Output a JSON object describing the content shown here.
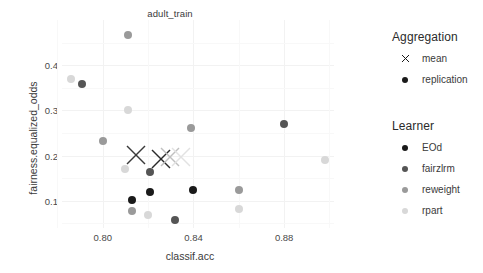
{
  "chart_data": {
    "type": "scatter",
    "title": "adult_train",
    "xlabel": "classif.acc",
    "ylabel": "fairness.equalized_odds",
    "xlim": [
      0.782,
      0.902
    ],
    "ylim": [
      0.04,
      0.5
    ],
    "xticks": [
      "0.80",
      "0.84",
      "0.88"
    ],
    "xtick_values": [
      0.8,
      0.84,
      0.88
    ],
    "yticks": [
      "0.1",
      "0.2",
      "0.3",
      "0.4"
    ],
    "ytick_values": [
      0.1,
      0.2,
      0.3,
      0.4
    ],
    "grid": true,
    "legend_position": "right",
    "legends": [
      {
        "title": "Aggregation",
        "entries": [
          {
            "label": "mean",
            "marker": "x"
          },
          {
            "label": "replication",
            "marker": "dot"
          }
        ]
      },
      {
        "title": "Learner",
        "entries": [
          {
            "label": "EOd",
            "marker": "dot",
            "color": "#1a1a1a"
          },
          {
            "label": "fairzlrm",
            "marker": "dot",
            "color": "#555555"
          },
          {
            "label": "reweight",
            "marker": "dot",
            "color": "#9a9a9a"
          },
          {
            "label": "rpart",
            "marker": "dot",
            "color": "#d8d8d8"
          }
        ]
      }
    ],
    "series": [
      {
        "name": "EOd",
        "color": "#1a1a1a",
        "aggregation": "replication",
        "points": [
          {
            "x": 0.821,
            "y": 0.12
          },
          {
            "x": 0.813,
            "y": 0.103
          },
          {
            "x": 0.84,
            "y": 0.123
          }
        ]
      },
      {
        "name": "fairzlrm",
        "color": "#555555",
        "aggregation": "replication",
        "points": [
          {
            "x": 0.791,
            "y": 0.358
          },
          {
            "x": 0.88,
            "y": 0.271
          },
          {
            "x": 0.821,
            "y": 0.164
          },
          {
            "x": 0.832,
            "y": 0.057
          }
        ]
      },
      {
        "name": "reweight",
        "color": "#9a9a9a",
        "aggregation": "replication",
        "points": [
          {
            "x": 0.811,
            "y": 0.466
          },
          {
            "x": 0.8,
            "y": 0.233
          },
          {
            "x": 0.839,
            "y": 0.262
          },
          {
            "x": 0.813,
            "y": 0.078
          },
          {
            "x": 0.86,
            "y": 0.124
          }
        ]
      },
      {
        "name": "rpart",
        "color": "#d8d8d8",
        "aggregation": "replication",
        "points": [
          {
            "x": 0.786,
            "y": 0.37
          },
          {
            "x": 0.811,
            "y": 0.3
          },
          {
            "x": 0.81,
            "y": 0.17
          },
          {
            "x": 0.82,
            "y": 0.068
          },
          {
            "x": 0.86,
            "y": 0.082
          },
          {
            "x": 0.898,
            "y": 0.19
          }
        ]
      },
      {
        "name": "EOd",
        "color": "#2a2a2a",
        "aggregation": "mean",
        "points": [
          {
            "x": 0.8255,
            "y": 0.192
          }
        ]
      },
      {
        "name": "fairzlrm",
        "color": "#3a3a3a",
        "aggregation": "mean",
        "points": [
          {
            "x": 0.8145,
            "y": 0.202
          }
        ]
      },
      {
        "name": "reweight",
        "color": "#c0c0c0",
        "aggregation": "mean",
        "points": [
          {
            "x": 0.8295,
            "y": 0.198
          }
        ]
      },
      {
        "name": "rpart",
        "color": "#e2e2e2",
        "aggregation": "mean",
        "points": [
          {
            "x": 0.8345,
            "y": 0.196
          }
        ]
      }
    ]
  }
}
